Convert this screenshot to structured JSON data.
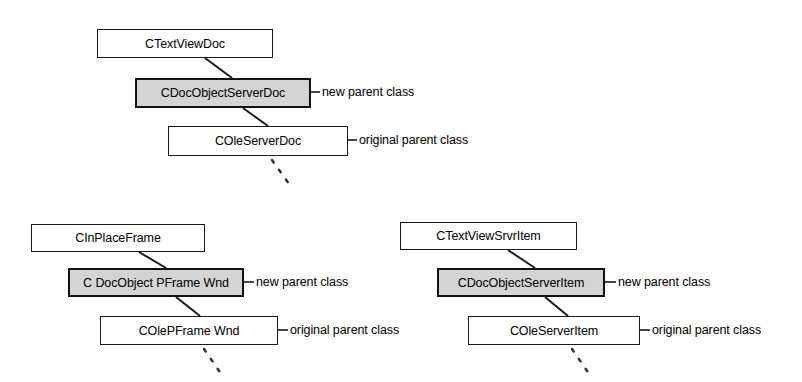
{
  "diagram": {
    "colors": {
      "shaded_fill": "#d4d4d4",
      "line": "#1a1a1a",
      "background": "#ffffff"
    },
    "groups": [
      {
        "id": "document-chain",
        "nodes": [
          {
            "label": "CTextViewDoc",
            "role": "derived-class",
            "shaded": false,
            "x": 97,
            "y": 29,
            "w": 176,
            "h": 29
          },
          {
            "label": "CDocObjectServerDoc",
            "role": "new-parent",
            "shaded": true,
            "x": 135,
            "y": 78,
            "w": 176,
            "h": 30
          },
          {
            "label": "COleServerDoc",
            "role": "original-parent",
            "shaded": false,
            "x": 168,
            "y": 126,
            "w": 180,
            "h": 30
          }
        ],
        "annotations": [
          {
            "text": "new parent class",
            "x": 320,
            "y": 85
          },
          {
            "text": "original parent class",
            "x": 356,
            "y": 133
          }
        ]
      },
      {
        "id": "frame-chain",
        "nodes": [
          {
            "label": "CInPlaceFrame",
            "role": "derived-class",
            "shaded": false,
            "x": 31,
            "y": 224,
            "w": 174,
            "h": 28
          },
          {
            "label": "C DocObject PFrame Wnd",
            "role": "new-parent",
            "shaded": true,
            "x": 68,
            "y": 268,
            "w": 176,
            "h": 29
          },
          {
            "label": "COlePFrame Wnd",
            "role": "original-parent",
            "shaded": false,
            "x": 100,
            "y": 316,
            "w": 178,
            "h": 29
          }
        ],
        "annotations": [
          {
            "text": "new parent class",
            "x": 256,
            "y": 275
          },
          {
            "text": "original parent class",
            "x": 289,
            "y": 323
          }
        ]
      },
      {
        "id": "item-chain",
        "nodes": [
          {
            "label": "CTextViewSrvrItem",
            "role": "derived-class",
            "shaded": false,
            "x": 400,
            "y": 222,
            "w": 177,
            "h": 28
          },
          {
            "label": "CDocObjectServerItem",
            "role": "new-parent",
            "shaded": true,
            "x": 437,
            "y": 268,
            "w": 168,
            "h": 29
          },
          {
            "label": "COleServerItem",
            "role": "original-parent",
            "shaded": false,
            "x": 468,
            "y": 316,
            "w": 172,
            "h": 29
          }
        ],
        "annotations": [
          {
            "text": "new parent class",
            "x": 620,
            "y": 275
          },
          {
            "text": "original parent class",
            "x": 651,
            "y": 323
          }
        ]
      }
    ]
  }
}
